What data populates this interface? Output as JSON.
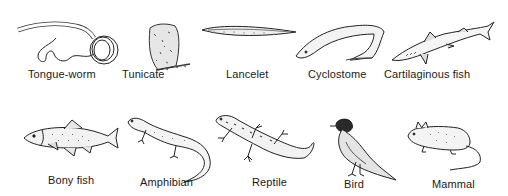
{
  "figure": {
    "rows": [
      {
        "organisms": [
          {
            "id": "tongue-worm",
            "label": "Tongue-worm",
            "icon": "tongue-worm-drawing"
          },
          {
            "id": "tunicate",
            "label": "Tunicate",
            "icon": "tunicate-drawing"
          },
          {
            "id": "lancelet",
            "label": "Lancelet",
            "icon": "lancelet-drawing"
          },
          {
            "id": "cyclostome",
            "label": "Cyclostome",
            "icon": "cyclostome-drawing"
          },
          {
            "id": "cartilaginous-fish",
            "label": "Cartilaginous fish",
            "icon": "shark-drawing"
          }
        ]
      },
      {
        "organisms": [
          {
            "id": "bony-fish",
            "label": "Bony fish",
            "icon": "trout-drawing"
          },
          {
            "id": "amphibian",
            "label": "Amphibian",
            "icon": "salamander-drawing"
          },
          {
            "id": "reptile",
            "label": "Reptile",
            "icon": "lizard-drawing"
          },
          {
            "id": "bird",
            "label": "Bird",
            "icon": "robin-drawing"
          },
          {
            "id": "mammal",
            "label": "Mammal",
            "icon": "mouse-drawing"
          }
        ]
      }
    ]
  }
}
